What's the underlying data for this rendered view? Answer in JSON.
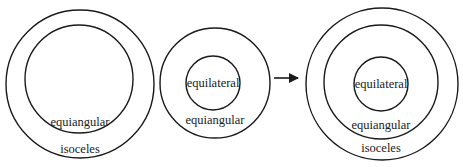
{
  "diagram": {
    "type": "nested-set-venn",
    "stroke_color": "#1a1a1a",
    "background": "#ffffff",
    "panels": [
      {
        "id": "left",
        "circles": [
          {
            "label": "isoceles",
            "cx": 80,
            "cy": 84,
            "r": 74,
            "label_x": 80,
            "label_y": 153
          },
          {
            "label": "equiangular",
            "cx": 79,
            "cy": 79,
            "r": 54,
            "label_x": 80,
            "label_y": 126
          }
        ]
      },
      {
        "id": "middle",
        "circles": [
          {
            "label": "equiangular",
            "cx": 215,
            "cy": 83,
            "r": 55,
            "label_x": 215,
            "label_y": 124
          },
          {
            "label": "equilateral",
            "cx": 213,
            "cy": 83,
            "r": 27,
            "label_x": 213,
            "label_y": 87
          }
        ]
      },
      {
        "id": "right",
        "circles": [
          {
            "label": "isoceles",
            "cx": 382,
            "cy": 84,
            "r": 76,
            "label_x": 381,
            "label_y": 152
          },
          {
            "label": "equiangular",
            "cx": 381,
            "cy": 82,
            "r": 57,
            "label_x": 381,
            "label_y": 129
          },
          {
            "label": "equilateral",
            "cx": 381,
            "cy": 84,
            "r": 27,
            "label_x": 381,
            "label_y": 88
          }
        ]
      }
    ],
    "arrow": {
      "x1": 274,
      "y1": 78,
      "x2": 298,
      "y2": 78,
      "icon": "right-arrow-icon"
    }
  }
}
